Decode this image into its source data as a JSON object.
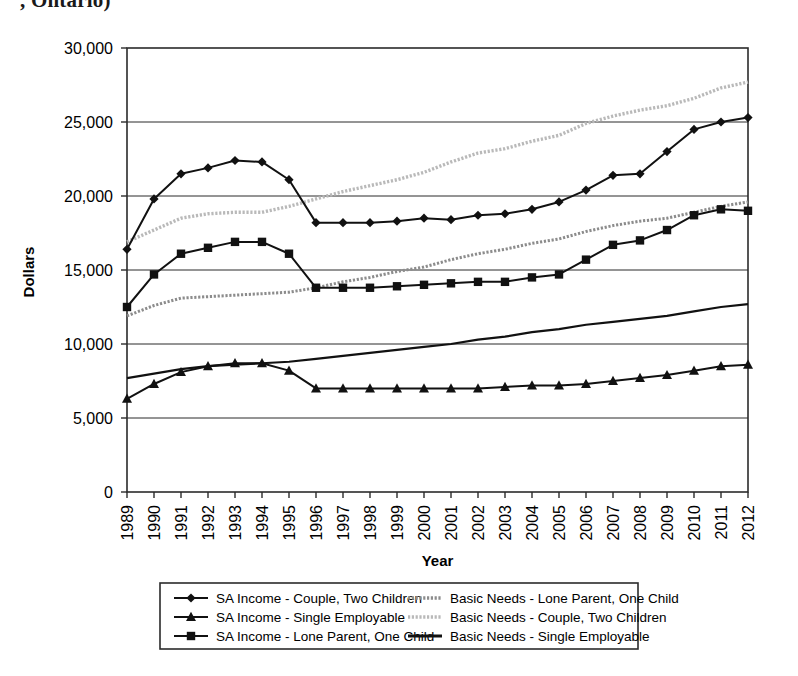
{
  "page": {
    "cut_off_title": ", Ontario)"
  },
  "axes": {
    "y_label": "Dollars",
    "x_label": "Year",
    "y_ticks": [
      "0",
      "5,000",
      "10,000",
      "15,000",
      "20,000",
      "25,000",
      "30,000"
    ],
    "x_ticks": [
      "1989",
      "1990",
      "1991",
      "1992",
      "1993",
      "1994",
      "1995",
      "1996",
      "1997",
      "1998",
      "1999",
      "2000",
      "2001",
      "2002",
      "2003",
      "2004",
      "2005",
      "2006",
      "2007",
      "2008",
      "2009",
      "2010",
      "2011",
      "2012"
    ]
  },
  "legend": {
    "entries": [
      {
        "label": "SA Income - Couple, Two Children",
        "marker": "diamond",
        "style": "solid-dark",
        "color": "#111111"
      },
      {
        "label": "SA Income - Single Employable",
        "marker": "triangle",
        "style": "solid-dark",
        "color": "#111111"
      },
      {
        "label": "SA Income - Lone Parent, One Child",
        "marker": "square",
        "style": "solid-dark",
        "color": "#111111"
      },
      {
        "label": "Basic Needs - Lone Parent, One Child",
        "marker": "none",
        "style": "dotted-mid-gray",
        "color": "#8c8c8c"
      },
      {
        "label": "Basic Needs - Couple, Two Children",
        "marker": "none",
        "style": "dotted-light-gray",
        "color": "#b9b9b9"
      },
      {
        "label": "Basic Needs - Single Employable",
        "marker": "none",
        "style": "solid-dark-thick",
        "color": "#111111"
      }
    ]
  },
  "chart_data": {
    "type": "line",
    "title": "",
    "xlabel": "Year",
    "ylabel": "Dollars",
    "ylim": [
      0,
      30000
    ],
    "grid": true,
    "legend_position": "bottom",
    "x": [
      1989,
      1990,
      1991,
      1992,
      1993,
      1994,
      1995,
      1996,
      1997,
      1998,
      1999,
      2000,
      2001,
      2002,
      2003,
      2004,
      2005,
      2006,
      2007,
      2008,
      2009,
      2010,
      2011,
      2012
    ],
    "categories": [
      "1989",
      "1990",
      "1991",
      "1992",
      "1993",
      "1994",
      "1995",
      "1996",
      "1997",
      "1998",
      "1999",
      "2000",
      "2001",
      "2002",
      "2003",
      "2004",
      "2005",
      "2006",
      "2007",
      "2008",
      "2009",
      "2010",
      "2011",
      "2012"
    ],
    "series": [
      {
        "name": "SA Income - Couple, Two Children",
        "marker": "diamond",
        "color": "#111111",
        "dash": "none",
        "width": 2.0,
        "values": [
          16400,
          19800,
          21500,
          21900,
          22400,
          22300,
          21100,
          18200,
          18200,
          18200,
          18300,
          18500,
          18400,
          18700,
          18800,
          19100,
          19600,
          20400,
          21400,
          21500,
          23000,
          24500,
          25000,
          25300
        ]
      },
      {
        "name": "SA Income - Lone Parent, One Child",
        "marker": "square",
        "color": "#111111",
        "dash": "none",
        "width": 2.0,
        "values": [
          12500,
          14700,
          16100,
          16500,
          16900,
          16900,
          16100,
          13800,
          13800,
          13800,
          13900,
          14000,
          14100,
          14200,
          14200,
          14500,
          14700,
          15700,
          16700,
          17000,
          17700,
          18700,
          19100,
          19000
        ]
      },
      {
        "name": "SA Income - Single Employable",
        "marker": "triangle",
        "color": "#111111",
        "dash": "none",
        "width": 2.0,
        "values": [
          6300,
          7300,
          8100,
          8500,
          8700,
          8700,
          8200,
          7000,
          7000,
          7000,
          7000,
          7000,
          7000,
          7000,
          7100,
          7200,
          7200,
          7300,
          7500,
          7700,
          7900,
          8200,
          8500,
          8600
        ]
      },
      {
        "name": "Basic Needs - Couple, Two Children",
        "marker": "none",
        "color": "#b9b9b9",
        "dash": "dotted",
        "width": 3.4,
        "values": [
          16900,
          17700,
          18500,
          18800,
          18900,
          18900,
          19300,
          19800,
          20300,
          20700,
          21100,
          21600,
          22300,
          22900,
          23200,
          23700,
          24100,
          24900,
          25400,
          25800,
          26100,
          26600,
          27300,
          27700
        ]
      },
      {
        "name": "Basic Needs - Lone Parent, One Child",
        "marker": "none",
        "color": "#8c8c8c",
        "dash": "dotted",
        "width": 3.0,
        "values": [
          11900,
          12600,
          13100,
          13200,
          13300,
          13400,
          13500,
          13800,
          14200,
          14500,
          14900,
          15200,
          15700,
          16100,
          16400,
          16800,
          17100,
          17600,
          18000,
          18300,
          18500,
          18900,
          19300,
          19600
        ]
      },
      {
        "name": "Basic Needs - Single Employable",
        "marker": "none",
        "color": "#111111",
        "dash": "none",
        "width": 2.2,
        "values": [
          7700,
          8000,
          8300,
          8500,
          8600,
          8700,
          8800,
          9000,
          9200,
          9400,
          9600,
          9800,
          10000,
          10300,
          10500,
          10800,
          11000,
          11300,
          11500,
          11700,
          11900,
          12200,
          12500,
          12700
        ]
      }
    ]
  }
}
